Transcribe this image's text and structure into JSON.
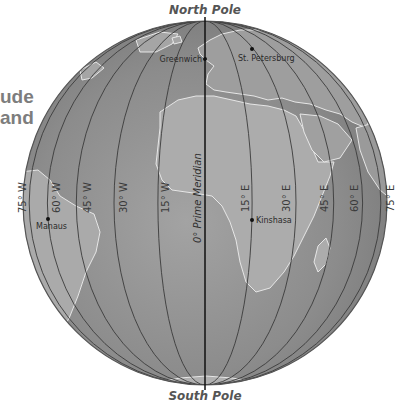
{
  "heading_fragment": {
    "line1": "ude",
    "line2": "and"
  },
  "globe": {
    "center": [
      205,
      203
    ],
    "radius": 182,
    "colors": {
      "ocean": "#8f8f8f",
      "ocean_dark": "#7a7a7a",
      "land": "#a9a9a9",
      "coast": "#e6e6e6",
      "meridian": "#3b3b3b",
      "prime_meridian": "#111111",
      "rim": "#555555"
    }
  },
  "poles": {
    "north": "North Pole",
    "south": "South Pole"
  },
  "prime_meridian": {
    "label": "0° Prime Meridian"
  },
  "meridians": [
    {
      "lon": -75,
      "label": "75° W"
    },
    {
      "lon": -60,
      "label": "60° W"
    },
    {
      "lon": -45,
      "label": "45° W"
    },
    {
      "lon": -30,
      "label": "30° W"
    },
    {
      "lon": -15,
      "label": "15° W"
    },
    {
      "lon": 15,
      "label": "15° E"
    },
    {
      "lon": 30,
      "label": "30° E"
    },
    {
      "lon": 45,
      "label": "45° E"
    },
    {
      "lon": 60,
      "label": "60° E"
    },
    {
      "lon": 75,
      "label": "75° E"
    }
  ],
  "cities": [
    {
      "name": "Greenwich",
      "x": 205,
      "y": 59
    },
    {
      "name": "St. Petersburg",
      "x": 252,
      "y": 49
    },
    {
      "name": "Manaus",
      "x": 48,
      "y": 219
    },
    {
      "name": "Kinshasa",
      "x": 252,
      "y": 220
    }
  ]
}
